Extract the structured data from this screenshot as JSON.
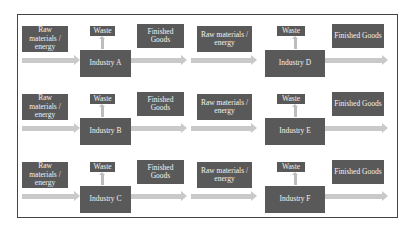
{
  "diagram": {
    "labels": {
      "raw": "Raw materials / energy",
      "waste": "Waste",
      "finished": "Finished Goods"
    },
    "industries": [
      {
        "name": "Industry A",
        "col": 0,
        "row": 0
      },
      {
        "name": "Industry D",
        "col": 1,
        "row": 0
      },
      {
        "name": "Industry B",
        "col": 0,
        "row": 1
      },
      {
        "name": "Industry E",
        "col": 1,
        "row": 1
      },
      {
        "name": "Industry C",
        "col": 0,
        "row": 2
      },
      {
        "name": "Industry F",
        "col": 1,
        "row": 2
      }
    ],
    "colors": {
      "box": "#595959",
      "arrow": "#c9c9c9",
      "border": "#444444"
    }
  }
}
